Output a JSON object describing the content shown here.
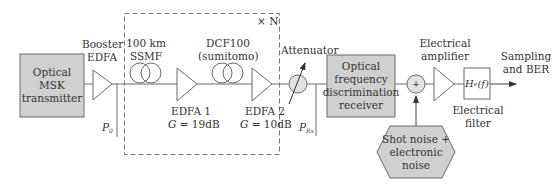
{
  "diagram": {
    "colors": {
      "line": "#6b6b6b",
      "block_fill": "#d0d0d0",
      "dashed": "#777777",
      "text": "#333333"
    },
    "transmitter": {
      "label_line1": "Optical MSK",
      "label_line2": "transmitter"
    },
    "booster": {
      "label_line1": "Booster",
      "label_line2": "EDFA",
      "power_label": "P",
      "power_sub": "0"
    },
    "span": {
      "repeat_label": "× N",
      "fiber1": {
        "label_line1": "100 km",
        "label_line2": "SSMF"
      },
      "edfa1": {
        "label_line1": "EDFA 1",
        "gain_symbol": "G",
        "gain_value": " = 19dB"
      },
      "fiber2": {
        "label_line1": "DCF100",
        "label_line2": "(sumitomo)"
      },
      "edfa2": {
        "label_line1": "EDFA 2",
        "gain_symbol": "G",
        "gain_value": " = 10dB"
      }
    },
    "attenuator": {
      "label": "Attenuator",
      "power_label": "P",
      "power_sub": "Rx"
    },
    "receiver": {
      "label_line1": "Optical",
      "label_line2": "frequency",
      "label_line3": "discrimination",
      "label_line4": "receiver"
    },
    "summer": {
      "symbol": "+"
    },
    "noise": {
      "label_line1": "Shot noise +",
      "label_line2": "electronic",
      "label_line3": "noise"
    },
    "electrical_amplifier": {
      "label_line1": "Electrical",
      "label_line2": "amplifier"
    },
    "electrical_filter": {
      "symbol": "H",
      "symbol_sub": "e",
      "symbol_arg": "(f)",
      "label_line1": "Electrical",
      "label_line2": "filter"
    },
    "output": {
      "label_line1": "Sampling",
      "label_line2": "and BER"
    }
  }
}
